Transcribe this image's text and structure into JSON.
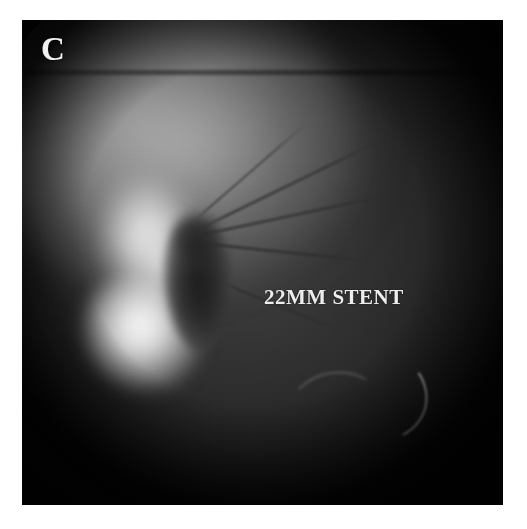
{
  "image": {
    "modality": "fluoroscopy",
    "panel_letter": "C",
    "annotation_label": "22MM STENT",
    "colors": {
      "page_background": "#ffffff",
      "film_dark": "#0d0d0d",
      "annotation_text": "#f0f0f0",
      "bright_contrast": "#ffffff"
    },
    "plate": {
      "left": 22,
      "top": 20,
      "width": 481,
      "height": 485
    },
    "features": {
      "collimated_field": "circular",
      "bright_region": "contrast-filled structure, left of centre",
      "dark_column": "stent / lesion shadow, centre",
      "guidewire": "curved radiopaque wire, lower right",
      "linear_structures": "thin catheter and vessel lines radiating superolaterally"
    }
  }
}
